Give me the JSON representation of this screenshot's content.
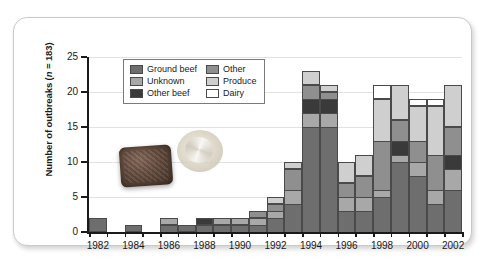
{
  "chart_data": {
    "type": "bar",
    "stacked": true,
    "title": "",
    "xlabel": "",
    "ylabel": "Number of outbreaks (n = 183)",
    "ylim": [
      0,
      25
    ],
    "yticks": [
      0,
      5,
      10,
      15,
      20,
      25
    ],
    "grid": true,
    "legend_position": "top-left inside",
    "categories": [
      "1982",
      "1983",
      "1984",
      "1985",
      "1986",
      "1987",
      "1988",
      "1989",
      "1990",
      "1991",
      "1992",
      "1993",
      "1994",
      "1995",
      "1996",
      "1997",
      "1998",
      "1999",
      "2000",
      "2001",
      "2002"
    ],
    "tick_labels": [
      "1982",
      "1984",
      "1986",
      "1988",
      "1990",
      "1992",
      "1994",
      "1996",
      "1998",
      "2000",
      "2002"
    ],
    "series": [
      {
        "name": "Ground beef",
        "color": "#6e6e6e",
        "values": [
          2,
          0,
          1,
          0,
          1,
          1,
          1,
          1,
          1,
          1,
          2,
          4,
          15,
          15,
          3,
          3,
          5,
          10,
          8,
          4,
          6
        ]
      },
      {
        "name": "Unknown",
        "color": "#a8a8a8",
        "values": [
          0,
          0,
          0,
          0,
          1,
          0,
          0,
          1,
          1,
          1,
          1,
          2,
          2,
          2,
          2,
          2,
          1,
          1,
          2,
          2,
          3
        ]
      },
      {
        "name": "Other beef",
        "color": "#3a3a3a",
        "values": [
          0,
          0,
          0,
          0,
          0,
          0,
          1,
          0,
          0,
          0,
          0,
          0,
          2,
          2,
          0,
          0,
          0,
          2,
          0,
          0,
          2
        ]
      },
      {
        "name": "Other",
        "color": "#8f8f8f",
        "values": [
          0,
          0,
          0,
          0,
          0,
          0,
          0,
          0,
          0,
          1,
          1,
          3,
          2,
          1,
          2,
          3,
          7,
          3,
          3,
          5,
          4
        ]
      },
      {
        "name": "Produce",
        "color": "#cfcfcf",
        "values": [
          0,
          0,
          0,
          0,
          0,
          0,
          0,
          0,
          0,
          0,
          1,
          1,
          2,
          1,
          3,
          3,
          6,
          5,
          5,
          7,
          6
        ]
      },
      {
        "name": "Dairy",
        "color": "#ffffff",
        "values": [
          0,
          0,
          0,
          0,
          0,
          0,
          0,
          0,
          0,
          0,
          0,
          0,
          0,
          0,
          0,
          0,
          2,
          0,
          1,
          1,
          0
        ]
      }
    ]
  },
  "legend": {
    "items": [
      {
        "label": "Ground beef",
        "color": "#6e6e6e"
      },
      {
        "label": "Other",
        "color": "#8f8f8f"
      },
      {
        "label": "Unknown",
        "color": "#a8a8a8"
      },
      {
        "label": "Produce",
        "color": "#cfcfcf"
      },
      {
        "label": "Other beef",
        "color": "#3a3a3a"
      },
      {
        "label": "Dairy",
        "color": "#ffffff"
      }
    ]
  },
  "decorations": [
    {
      "name": "ground-beef-patty-photo"
    },
    {
      "name": "produce-lettuce-photo"
    }
  ]
}
